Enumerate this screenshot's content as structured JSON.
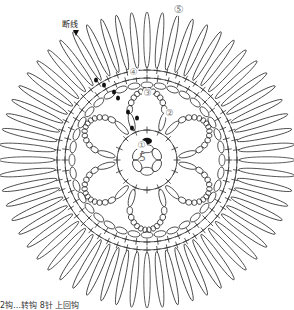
{
  "labels": {
    "break_yarn": "断线",
    "center_count": "5",
    "footer_caption": "2钩…转钩 8针 上回钩"
  },
  "round_markers": [
    {
      "id": "round-1",
      "text": "①",
      "x": 136,
      "y": 120
    },
    {
      "id": "round-2",
      "text": "②",
      "x": 182,
      "y": 112
    },
    {
      "id": "round-3",
      "text": "③",
      "x": 142,
      "y": 88
    },
    {
      "id": "round-4",
      "text": "④",
      "x": 126,
      "y": 68
    },
    {
      "id": "round-5",
      "text": "⑤",
      "x": 176,
      "y": 7
    }
  ],
  "geometry": {
    "center_x": 147,
    "center_y": 160,
    "center_ring_radius": 15,
    "center_ring_chains": 6,
    "round1_radius": 30,
    "round1_stitches": 16,
    "petal_count": 6,
    "petal_inner_radius": 32,
    "petal_outer_radius": 70,
    "round3_radius": 75,
    "round3_chains": 36,
    "round4_radius": 82,
    "round4_stitches": 48,
    "round4b_radius": 90,
    "round4b_stitches": 56,
    "outer_petal_inner_radius": 92,
    "outer_petal_outer_radius": 148,
    "outer_petal_count": 60
  },
  "colors": {
    "stroke": "#333333",
    "marker": "#888888",
    "fill_dot": "#111111"
  }
}
